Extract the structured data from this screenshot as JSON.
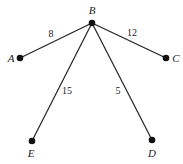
{
  "graph": {
    "type": "weighted-tree",
    "nodes": [
      {
        "id": "B",
        "label": "B",
        "x": 92,
        "y": 23,
        "label_x": 92,
        "label_y": 14,
        "anchor": "middle"
      },
      {
        "id": "A",
        "label": "A",
        "x": 20,
        "y": 58,
        "label_x": 11,
        "label_y": 62,
        "anchor": "middle"
      },
      {
        "id": "C",
        "label": "C",
        "x": 166,
        "y": 58,
        "label_x": 176,
        "label_y": 62,
        "anchor": "middle"
      },
      {
        "id": "E",
        "label": "E",
        "x": 32,
        "y": 141,
        "label_x": 31,
        "label_y": 157,
        "anchor": "middle"
      },
      {
        "id": "D",
        "label": "D",
        "x": 152,
        "y": 140,
        "label_x": 152,
        "label_y": 157,
        "anchor": "middle"
      }
    ],
    "edges": [
      {
        "from": "B",
        "to": "A",
        "weight": "8",
        "label_x": 51,
        "label_y": 37
      },
      {
        "from": "B",
        "to": "C",
        "weight": "12",
        "label_x": 132,
        "label_y": 36
      },
      {
        "from": "B",
        "to": "E",
        "weight": "15",
        "label_x": 67,
        "label_y": 94
      },
      {
        "from": "B",
        "to": "D",
        "weight": "5",
        "label_x": 118,
        "label_y": 94
      }
    ]
  }
}
